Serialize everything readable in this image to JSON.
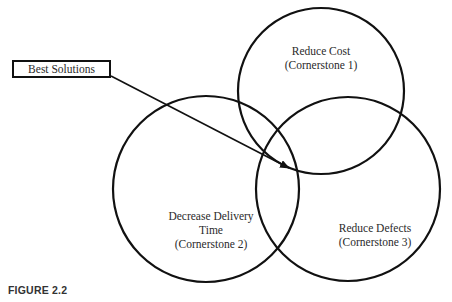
{
  "diagram": {
    "type": "venn",
    "callout": {
      "label": "Best Solutions",
      "points_to": "intersection of all three circles"
    },
    "circles": [
      {
        "id": "c1",
        "line1": "Reduce Cost",
        "line2": "(Cornerstone 1)",
        "cx": 321,
        "cy": 91,
        "r": 83
      },
      {
        "id": "c2",
        "line1": "Decrease Delivery",
        "line2": "Time",
        "line3": "(Cornerstone 2)",
        "cx": 206,
        "cy": 189,
        "r": 93
      },
      {
        "id": "c3",
        "line1": "Reduce Defects",
        "line2": "(Cornerstone 3)",
        "cx": 348,
        "cy": 189,
        "r": 92
      }
    ],
    "stroke_color": "#111111"
  },
  "caption": "FIGURE 2.2"
}
